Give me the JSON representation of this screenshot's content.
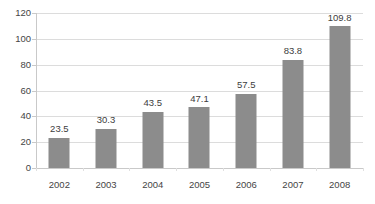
{
  "chart_data": {
    "type": "bar",
    "title": "",
    "subtitle": "",
    "xlabel": "",
    "ylabel": "",
    "categories": [
      "2002",
      "2003",
      "2004",
      "2005",
      "2006",
      "2007",
      "2008"
    ],
    "values": [
      23.5,
      30.3,
      43.5,
      47.1,
      57.5,
      83.8,
      109.8
    ],
    "data_labels": [
      "23.5",
      "30.3",
      "43.5",
      "47.1",
      "57.5",
      "83.8",
      "109.8"
    ],
    "ylim": [
      0,
      120
    ],
    "ytick_values": [
      0,
      20,
      40,
      60,
      80,
      100,
      120
    ],
    "ytick_labels": [
      "0",
      "20",
      "40",
      "60",
      "80",
      "100",
      "120"
    ],
    "grid": true,
    "grid_orientation": "horizontal",
    "legend": false,
    "legend_position": "none",
    "series": [
      {
        "name": "",
        "values": [
          23.5,
          30.3,
          43.5,
          47.1,
          57.5,
          83.8,
          109.8
        ]
      }
    ],
    "colors": {
      "bar": "#8c8c8c",
      "gridline": "#dcdcdc",
      "axis": "#c9c9c9",
      "tick_text": "#454545",
      "label_text": "#3d3d3d",
      "background": "#ffffff"
    }
  }
}
